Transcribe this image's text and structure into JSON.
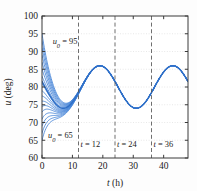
{
  "chart_data": {
    "type": "line",
    "title": "",
    "xlabel": "t (h)",
    "ylabel": "u (deg)",
    "xlim": [
      0,
      48
    ],
    "ylim": [
      60,
      100
    ],
    "xticks": [
      0,
      10,
      20,
      30,
      40
    ],
    "yticks": [
      60,
      65,
      70,
      75,
      80,
      85,
      90,
      95,
      100
    ],
    "xticklabels": [
      "0",
      "10",
      "20",
      "30",
      "40"
    ],
    "yticklabels": [
      "60",
      "65",
      "70",
      "75",
      "80",
      "85",
      "90",
      "95",
      "100"
    ],
    "grid": "horizontal-dotted",
    "legend": "none",
    "line_color": "#3b7dd6",
    "annotations": [
      {
        "name": "upper-initial-condition",
        "text": "u0 = 95",
        "base": "u",
        "sub": "0",
        "value": "= 95",
        "x": 3.5,
        "y": 92.2
      },
      {
        "name": "lower-initial-condition",
        "text": "u0 = 65",
        "base": "u",
        "sub": "0",
        "value": "= 65",
        "x": 2.0,
        "y": 65.6
      },
      {
        "name": "marker-label-t12",
        "text": "t = 12",
        "value": 12,
        "y": 63.2
      },
      {
        "name": "marker-label-t24",
        "text": "t = 24",
        "value": 24,
        "y": 63.2
      },
      {
        "name": "marker-label-t36",
        "text": "t = 36",
        "value": 36,
        "y": 63.2
      }
    ],
    "vlines": [
      12,
      24,
      36
    ],
    "vline_style": "dashed",
    "vline_color": "#555555",
    "series_description": "Family of solution curves for varying initial condition u0, converging to a common periodic attractor",
    "initial_values": [
      65,
      67,
      69,
      71,
      73,
      74.5,
      76,
      77.5,
      79,
      81,
      83,
      85,
      87,
      89,
      91,
      93,
      95
    ],
    "attractor": {
      "mean": 80.0,
      "amplitude": 6.0,
      "period": 24,
      "peak_value": 86.0,
      "trough_value": 74.0,
      "first_peak_t": 19,
      "first_trough_t": 31,
      "second_peak_t": 43
    },
    "decay_rate": 0.3,
    "x_samples": [
      0,
      2,
      4,
      6,
      8,
      10,
      12,
      14,
      16,
      18,
      19,
      20,
      22,
      24,
      26,
      28,
      30,
      31,
      32,
      34,
      36,
      38,
      40,
      42,
      43,
      44,
      46,
      48
    ],
    "attractor_values": [
      74.0,
      75.4,
      79.0,
      83.0,
      85.5,
      86.0,
      84.3,
      80.9,
      77.1,
      74.6,
      74.0,
      74.1,
      76.2,
      80.0,
      83.8,
      85.8,
      86.0,
      85.5,
      84.6,
      81.3,
      77.4,
      74.7,
      74.0,
      74.3,
      75.0,
      76.6,
      80.5,
      84.0
    ]
  }
}
